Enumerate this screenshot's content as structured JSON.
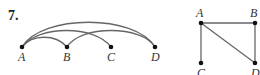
{
  "problem_number": "7.",
  "graph_left": {
    "type": "arc-diagram",
    "nodes": [
      {
        "id": "A",
        "label": "A",
        "x": 22,
        "y": 47
      },
      {
        "id": "B",
        "label": "B",
        "x": 67,
        "y": 47
      },
      {
        "id": "C",
        "label": "C",
        "x": 111,
        "y": 47
      },
      {
        "id": "D",
        "label": "D",
        "x": 155,
        "y": 47
      }
    ],
    "edges": [
      [
        "A",
        "B"
      ],
      [
        "A",
        "C"
      ],
      [
        "A",
        "D"
      ],
      [
        "B",
        "D"
      ]
    ]
  },
  "graph_right": {
    "type": "square-layout",
    "nodes": [
      {
        "id": "A",
        "label": "A",
        "x": 201,
        "y": 23
      },
      {
        "id": "B",
        "label": "B",
        "x": 255,
        "y": 23
      },
      {
        "id": "C",
        "label": "C",
        "x": 201,
        "y": 63
      },
      {
        "id": "D",
        "label": "D",
        "x": 255,
        "y": 63
      }
    ],
    "edges": [
      [
        "A",
        "B"
      ],
      [
        "A",
        "C"
      ],
      [
        "A",
        "D"
      ],
      [
        "B",
        "D"
      ]
    ]
  },
  "colors": {
    "edge": "#666666",
    "node": "#111111",
    "label": "#333333"
  }
}
